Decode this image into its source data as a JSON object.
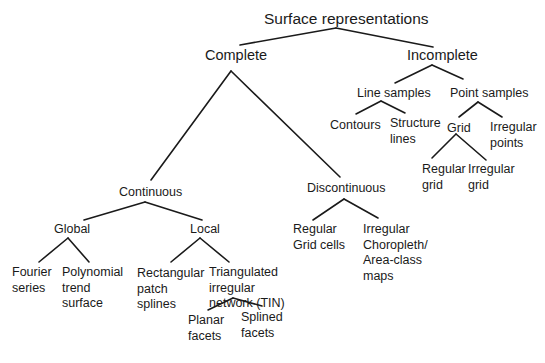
{
  "diagram": {
    "type": "tree",
    "title": "Surface representations",
    "nodes": {
      "root": {
        "label": "Surface representations"
      },
      "complete": {
        "label": "Complete"
      },
      "incomplete": {
        "label": "Incomplete"
      },
      "continuous": {
        "label": "Continuous"
      },
      "discontinuous": {
        "label": "Discontinuous"
      },
      "global": {
        "label": "Global"
      },
      "local": {
        "label": "Local"
      },
      "fourier": {
        "lines": [
          "Fourier",
          "series"
        ]
      },
      "polynomial": {
        "lines": [
          "Polynomial",
          "trend",
          "surface"
        ]
      },
      "rect_patch": {
        "lines": [
          "Rectangular",
          "patch",
          "splines"
        ]
      },
      "tin": {
        "lines": [
          "Triangulated",
          "irregular",
          "network (TIN)"
        ]
      },
      "planar": {
        "lines": [
          "Planar",
          "facets"
        ]
      },
      "splined": {
        "lines": [
          "Splined",
          "facets"
        ]
      },
      "regular_grid_cells": {
        "lines": [
          "Regular",
          "Grid cells"
        ]
      },
      "irregular_choropleth": {
        "lines": [
          "Irregular",
          "Choropleth/",
          "Area-class",
          "maps"
        ]
      },
      "line_samples": {
        "label": "Line samples"
      },
      "point_samples": {
        "label": "Point samples"
      },
      "contours": {
        "label": "Contours"
      },
      "structure_lines": {
        "lines": [
          "Structure",
          "lines"
        ]
      },
      "grid": {
        "label": "Grid"
      },
      "irregular_points": {
        "lines": [
          "Irregular",
          "points"
        ]
      },
      "regular_grid": {
        "lines": [
          "Regular",
          "grid"
        ]
      },
      "irregular_grid": {
        "lines": [
          "Irregular",
          "grid"
        ]
      }
    },
    "edges": [
      [
        "root",
        "complete"
      ],
      [
        "root",
        "incomplete"
      ],
      [
        "complete",
        "continuous"
      ],
      [
        "complete",
        "discontinuous"
      ],
      [
        "continuous",
        "global"
      ],
      [
        "continuous",
        "local"
      ],
      [
        "global",
        "fourier"
      ],
      [
        "global",
        "polynomial"
      ],
      [
        "local",
        "rect_patch"
      ],
      [
        "local",
        "tin"
      ],
      [
        "tin",
        "planar"
      ],
      [
        "tin",
        "splined"
      ],
      [
        "discontinuous",
        "regular_grid_cells"
      ],
      [
        "discontinuous",
        "irregular_choropleth"
      ],
      [
        "incomplete",
        "line_samples"
      ],
      [
        "incomplete",
        "point_samples"
      ],
      [
        "line_samples",
        "contours"
      ],
      [
        "line_samples",
        "structure_lines"
      ],
      [
        "point_samples",
        "grid"
      ],
      [
        "point_samples",
        "irregular_points"
      ],
      [
        "grid",
        "regular_grid"
      ],
      [
        "grid",
        "irregular_grid"
      ]
    ],
    "colors": {
      "line": "#1a1a1a",
      "text": "#1a1a1a",
      "background": "#ffffff"
    }
  }
}
